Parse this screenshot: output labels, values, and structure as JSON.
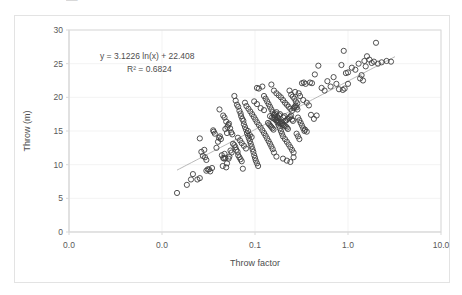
{
  "chart_data": {
    "type": "scatter",
    "title": "",
    "xlabel": "Throw factor",
    "ylabel": "Throw (m)",
    "xscale": "log",
    "yscale": "linear",
    "xlim": [
      0.001,
      10
    ],
    "ylim": [
      0,
      30
    ],
    "xticks": [
      0.001,
      0.01,
      0.1,
      1,
      10
    ],
    "xticklabels": [
      "0.0",
      "0.0",
      "0.1",
      "1.0",
      "10.0"
    ],
    "yticks": [
      0,
      5,
      10,
      15,
      20,
      25,
      30
    ],
    "yticklabels": [
      "0",
      "5",
      "10",
      "15",
      "20",
      "25",
      "30"
    ],
    "grid": "faint-major-both",
    "legend": "none",
    "marker": "open-circle",
    "marker_color": "#404040",
    "trendline": {
      "type": "logarithmic",
      "equation": "y = 3.1226 ln(x)  + 22.408",
      "r_squared_label": "R² = 0.6824",
      "slope": 3.1226,
      "intercept": 22.408,
      "r_squared": 0.6824,
      "color": "#a6a6a6",
      "x_start": 0.0145,
      "x_end": 3.2
    },
    "annotations": [
      {
        "text": "y = 3.1226 ln(x)  + 22.408",
        "x_px": 100,
        "y_px": 59
      },
      {
        "text": "R² = 0.6824",
        "x_px": 127,
        "y_px": 72
      }
    ],
    "top_artifact_text": "▬▬",
    "points": [
      [
        0.0145,
        5.8
      ],
      [
        0.0185,
        7.0
      ],
      [
        0.0205,
        7.8
      ],
      [
        0.0215,
        8.6
      ],
      [
        0.024,
        7.8
      ],
      [
        0.0255,
        8.0
      ],
      [
        0.03,
        9.1
      ],
      [
        0.031,
        9.3
      ],
      [
        0.032,
        9.3
      ],
      [
        0.0345,
        9.5
      ],
      [
        0.033,
        9.0
      ],
      [
        0.0265,
        11.9
      ],
      [
        0.0275,
        11.3
      ],
      [
        0.029,
        11.1
      ],
      [
        0.03,
        10.7
      ],
      [
        0.0285,
        12.2
      ],
      [
        0.0255,
        13.9
      ],
      [
        0.036,
        14.9
      ],
      [
        0.0355,
        15.1
      ],
      [
        0.037,
        14.6
      ],
      [
        0.0385,
        12.5
      ],
      [
        0.04,
        13.4
      ],
      [
        0.041,
        14.0
      ],
      [
        0.042,
        14.2
      ],
      [
        0.043,
        13.8
      ],
      [
        0.044,
        11.4
      ],
      [
        0.0455,
        11.0
      ],
      [
        0.0465,
        10.9
      ],
      [
        0.047,
        11.6
      ],
      [
        0.048,
        11.0
      ],
      [
        0.045,
        9.8
      ],
      [
        0.049,
        9.6
      ],
      [
        0.05,
        10.2
      ],
      [
        0.052,
        10.9
      ],
      [
        0.053,
        11.2
      ],
      [
        0.0415,
        18.2
      ],
      [
        0.0455,
        17.3
      ],
      [
        0.047,
        17.0
      ],
      [
        0.049,
        16.4
      ],
      [
        0.0505,
        15.6
      ],
      [
        0.0515,
        15.9
      ],
      [
        0.0525,
        16.1
      ],
      [
        0.054,
        15.4
      ],
      [
        0.0555,
        14.8
      ],
      [
        0.057,
        14.5
      ],
      [
        0.058,
        13.1
      ],
      [
        0.06,
        12.9
      ],
      [
        0.0615,
        12.6
      ],
      [
        0.063,
        12.2
      ],
      [
        0.065,
        11.9
      ],
      [
        0.066,
        11.4
      ],
      [
        0.068,
        11.1
      ],
      [
        0.07,
        10.8
      ],
      [
        0.072,
        10.5
      ],
      [
        0.074,
        9.4
      ],
      [
        0.06,
        20.2
      ],
      [
        0.062,
        19.5
      ],
      [
        0.064,
        18.9
      ],
      [
        0.066,
        18.6
      ],
      [
        0.068,
        18.0
      ],
      [
        0.07,
        17.6
      ],
      [
        0.071,
        17.2
      ],
      [
        0.073,
        16.8
      ],
      [
        0.075,
        16.5
      ],
      [
        0.076,
        16.0
      ],
      [
        0.078,
        15.6
      ],
      [
        0.08,
        15.2
      ],
      [
        0.082,
        14.7
      ],
      [
        0.084,
        14.3
      ],
      [
        0.086,
        13.9
      ],
      [
        0.088,
        13.5
      ],
      [
        0.09,
        13.1
      ],
      [
        0.092,
        12.7
      ],
      [
        0.094,
        12.3
      ],
      [
        0.096,
        11.9
      ],
      [
        0.098,
        11.4
      ],
      [
        0.1,
        11.0
      ],
      [
        0.102,
        10.6
      ],
      [
        0.105,
        10.2
      ],
      [
        0.108,
        9.8
      ],
      [
        0.078,
        19.2
      ],
      [
        0.081,
        18.7
      ],
      [
        0.085,
        18.3
      ],
      [
        0.089,
        17.9
      ],
      [
        0.093,
        17.5
      ],
      [
        0.097,
        17.1
      ],
      [
        0.101,
        16.7
      ],
      [
        0.105,
        16.3
      ],
      [
        0.11,
        15.9
      ],
      [
        0.115,
        15.5
      ],
      [
        0.12,
        15.1
      ],
      [
        0.125,
        14.7
      ],
      [
        0.13,
        14.3
      ],
      [
        0.135,
        13.9
      ],
      [
        0.14,
        13.5
      ],
      [
        0.145,
        13.1
      ],
      [
        0.15,
        12.7
      ],
      [
        0.155,
        12.3
      ],
      [
        0.16,
        11.8
      ],
      [
        0.17,
        11.2
      ],
      [
        0.105,
        21.4
      ],
      [
        0.11,
        21.3
      ],
      [
        0.12,
        21.6
      ],
      [
        0.125,
        20.2
      ],
      [
        0.13,
        19.8
      ],
      [
        0.135,
        19.4
      ],
      [
        0.14,
        19.0
      ],
      [
        0.145,
        18.6
      ],
      [
        0.15,
        18.2
      ],
      [
        0.155,
        17.8
      ],
      [
        0.16,
        17.4
      ],
      [
        0.165,
        17.0
      ],
      [
        0.17,
        16.6
      ],
      [
        0.175,
        16.2
      ],
      [
        0.18,
        15.8
      ],
      [
        0.185,
        15.4
      ],
      [
        0.19,
        15.0
      ],
      [
        0.195,
        14.6
      ],
      [
        0.2,
        14.2
      ],
      [
        0.21,
        13.8
      ],
      [
        0.22,
        13.4
      ],
      [
        0.23,
        13.0
      ],
      [
        0.24,
        12.6
      ],
      [
        0.25,
        12.2
      ],
      [
        0.26,
        11.8
      ],
      [
        0.15,
        21.9
      ],
      [
        0.16,
        21.0
      ],
      [
        0.17,
        20.6
      ],
      [
        0.18,
        20.3
      ],
      [
        0.19,
        20.0
      ],
      [
        0.2,
        19.6
      ],
      [
        0.21,
        19.2
      ],
      [
        0.22,
        18.9
      ],
      [
        0.23,
        18.6
      ],
      [
        0.24,
        18.3
      ],
      [
        0.25,
        18.0
      ],
      [
        0.145,
        17.2
      ],
      [
        0.152,
        17.0
      ],
      [
        0.158,
        16.9
      ],
      [
        0.164,
        16.7
      ],
      [
        0.17,
        16.6
      ],
      [
        0.176,
        16.4
      ],
      [
        0.182,
        16.3
      ],
      [
        0.188,
        16.1
      ],
      [
        0.194,
        16.0
      ],
      [
        0.2,
        15.9
      ],
      [
        0.206,
        15.8
      ],
      [
        0.212,
        16.5
      ],
      [
        0.218,
        16.6
      ],
      [
        0.224,
        16.8
      ],
      [
        0.138,
        16.2
      ],
      [
        0.142,
        16.0
      ],
      [
        0.146,
        15.8
      ],
      [
        0.15,
        15.6
      ],
      [
        0.154,
        15.4
      ],
      [
        0.158,
        15.2
      ],
      [
        0.162,
        17.4
      ],
      [
        0.166,
        17.6
      ],
      [
        0.17,
        17.8
      ],
      [
        0.174,
        17.1
      ],
      [
        0.178,
        16.9
      ],
      [
        0.182,
        17.3
      ],
      [
        0.186,
        17.5
      ],
      [
        0.19,
        16.4
      ],
      [
        0.196,
        16.2
      ],
      [
        0.202,
        17.0
      ],
      [
        0.208,
        17.2
      ],
      [
        0.214,
        15.7
      ],
      [
        0.22,
        15.5
      ],
      [
        0.226,
        15.3
      ],
      [
        0.232,
        16.9
      ],
      [
        0.238,
        17.1
      ],
      [
        0.244,
        17.3
      ],
      [
        0.25,
        16.7
      ],
      [
        0.256,
        16.5
      ],
      [
        0.262,
        18.4
      ],
      [
        0.268,
        18.6
      ],
      [
        0.274,
        18.8
      ],
      [
        0.28,
        18.5
      ],
      [
        0.286,
        18.2
      ],
      [
        0.245,
        20.4
      ],
      [
        0.255,
        20.1
      ],
      [
        0.265,
        19.8
      ],
      [
        0.275,
        19.4
      ],
      [
        0.285,
        19.1
      ],
      [
        0.295,
        20.6
      ],
      [
        0.305,
        20.2
      ],
      [
        0.29,
        17.0
      ],
      [
        0.3,
        16.6
      ],
      [
        0.31,
        16.2
      ],
      [
        0.32,
        15.8
      ],
      [
        0.33,
        15.4
      ],
      [
        0.34,
        15.0
      ],
      [
        0.28,
        14.6
      ],
      [
        0.29,
        14.2
      ],
      [
        0.3,
        13.8
      ],
      [
        0.26,
        11.1
      ],
      [
        0.24,
        10.4
      ],
      [
        0.22,
        10.6
      ],
      [
        0.2,
        10.9
      ],
      [
        0.32,
        22.1
      ],
      [
        0.335,
        22.2
      ],
      [
        0.35,
        22.0
      ],
      [
        0.33,
        19.6
      ],
      [
        0.36,
        19.2
      ],
      [
        0.38,
        18.8
      ],
      [
        0.4,
        17.4
      ],
      [
        0.43,
        16.8
      ],
      [
        0.46,
        17.3
      ],
      [
        0.39,
        22.2
      ],
      [
        0.41,
        22.1
      ],
      [
        0.44,
        23.4
      ],
      [
        0.48,
        24.7
      ],
      [
        0.52,
        21.4
      ],
      [
        0.56,
        21.0
      ],
      [
        0.6,
        22.4
      ],
      [
        0.65,
        21.6
      ],
      [
        0.7,
        23.0
      ],
      [
        0.75,
        22.0
      ],
      [
        0.8,
        21.2
      ],
      [
        0.85,
        24.8
      ],
      [
        0.9,
        26.9
      ],
      [
        0.95,
        23.6
      ],
      [
        1.0,
        22.0
      ],
      [
        1.0,
        23.7
      ],
      [
        1.1,
        24.4
      ],
      [
        1.2,
        24.1
      ],
      [
        1.3,
        25.0
      ],
      [
        1.4,
        23.3
      ],
      [
        1.5,
        25.4
      ],
      [
        1.6,
        26.1
      ],
      [
        1.7,
        25.6
      ],
      [
        1.8,
        25.1
      ],
      [
        1.9,
        25.3
      ],
      [
        2.0,
        28.1
      ],
      [
        2.1,
        25.0
      ],
      [
        2.3,
        25.2
      ],
      [
        2.6,
        25.4
      ],
      [
        2.9,
        25.3
      ],
      [
        1.55,
        24.6
      ],
      [
        1.45,
        22.5
      ],
      [
        1.35,
        22.8
      ],
      [
        0.92,
        21.3
      ],
      [
        0.88,
        21.1
      ],
      [
        0.36,
        14.9
      ],
      [
        0.345,
        15.2
      ],
      [
        0.27,
        20.8
      ],
      [
        0.235,
        21.0
      ],
      [
        0.125,
        18.1
      ],
      [
        0.115,
        18.4
      ],
      [
        0.105,
        19.0
      ],
      [
        0.098,
        19.4
      ],
      [
        0.092,
        14.1
      ],
      [
        0.088,
        14.4
      ],
      [
        0.084,
        15.0
      ],
      [
        0.08,
        12.4
      ],
      [
        0.076,
        12.8
      ],
      [
        0.072,
        13.2
      ],
      [
        0.069,
        13.6
      ],
      [
        0.0655,
        14.0
      ],
      [
        0.056,
        11.8
      ],
      [
        0.0545,
        12.1
      ],
      [
        0.05,
        14.7
      ],
      [
        0.048,
        15.3
      ]
    ]
  }
}
